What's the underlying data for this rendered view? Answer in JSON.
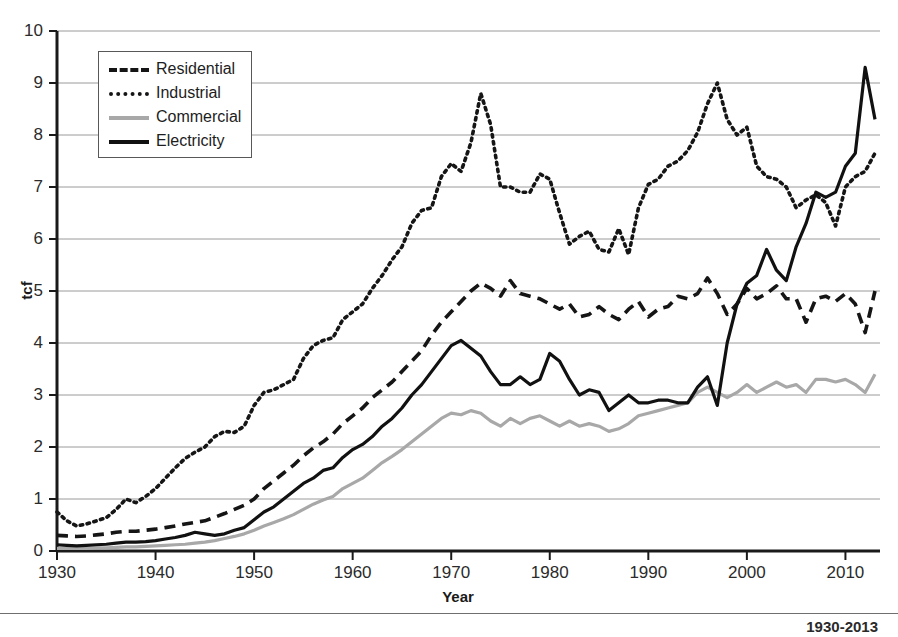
{
  "chart_data": {
    "type": "line",
    "title": "",
    "xlabel": "Year",
    "ylabel": "tcf",
    "xlim": [
      1930,
      2013
    ],
    "ylim": [
      0,
      10
    ],
    "grid": true,
    "legend_position": "top-left",
    "xticks": [
      "1930",
      "1940",
      "1950",
      "1960",
      "1970",
      "1980",
      "1990",
      "2000",
      "2010"
    ],
    "yticks": [
      "0",
      "1",
      "2",
      "3",
      "4",
      "5",
      "6",
      "7",
      "8",
      "9",
      "10"
    ],
    "x": [
      1930,
      1931,
      1932,
      1933,
      1934,
      1935,
      1936,
      1937,
      1938,
      1939,
      1940,
      1941,
      1942,
      1943,
      1944,
      1945,
      1946,
      1947,
      1948,
      1949,
      1950,
      1951,
      1952,
      1953,
      1954,
      1955,
      1956,
      1957,
      1958,
      1959,
      1960,
      1961,
      1962,
      1963,
      1964,
      1965,
      1966,
      1967,
      1968,
      1969,
      1970,
      1971,
      1972,
      1973,
      1974,
      1975,
      1976,
      1977,
      1978,
      1979,
      1980,
      1981,
      1982,
      1983,
      1984,
      1985,
      1986,
      1987,
      1988,
      1989,
      1990,
      1991,
      1992,
      1993,
      1994,
      1995,
      1996,
      1997,
      1998,
      1999,
      2000,
      2001,
      2002,
      2003,
      2004,
      2005,
      2006,
      2007,
      2008,
      2009,
      2010,
      2011,
      2012,
      2013
    ],
    "series": [
      {
        "name": "Residential",
        "style": "dashed",
        "color": "#151515",
        "values": [
          0.3,
          0.29,
          0.28,
          0.29,
          0.31,
          0.33,
          0.36,
          0.38,
          0.38,
          0.4,
          0.42,
          0.45,
          0.48,
          0.52,
          0.55,
          0.58,
          0.65,
          0.72,
          0.8,
          0.88,
          1.0,
          1.2,
          1.35,
          1.5,
          1.65,
          1.83,
          1.98,
          2.1,
          2.25,
          2.45,
          2.6,
          2.75,
          2.95,
          3.1,
          3.25,
          3.45,
          3.65,
          3.85,
          4.15,
          4.4,
          4.6,
          4.8,
          5.0,
          5.15,
          5.05,
          4.9,
          5.2,
          4.95,
          4.9,
          4.85,
          4.75,
          4.65,
          4.75,
          4.5,
          4.55,
          4.7,
          4.55,
          4.45,
          4.65,
          4.8,
          4.5,
          4.65,
          4.7,
          4.9,
          4.85,
          4.95,
          5.25,
          4.95,
          4.55,
          4.75,
          5.05,
          4.85,
          4.95,
          5.1,
          4.85,
          4.85,
          4.4,
          4.85,
          4.9,
          4.8,
          4.95,
          4.75,
          4.2,
          5.0
        ]
      },
      {
        "name": "Industrial",
        "style": "dotted",
        "color": "#151515",
        "values": [
          0.75,
          0.58,
          0.48,
          0.52,
          0.58,
          0.64,
          0.8,
          1.0,
          0.93,
          1.05,
          1.2,
          1.4,
          1.6,
          1.78,
          1.9,
          2.0,
          2.2,
          2.3,
          2.28,
          2.4,
          2.8,
          3.05,
          3.1,
          3.2,
          3.3,
          3.7,
          3.95,
          4.05,
          4.1,
          4.45,
          4.6,
          4.75,
          5.05,
          5.3,
          5.6,
          5.85,
          6.3,
          6.55,
          6.6,
          7.2,
          7.45,
          7.3,
          7.85,
          8.8,
          8.2,
          7.0,
          7.0,
          6.9,
          6.9,
          7.25,
          7.15,
          6.5,
          5.9,
          6.05,
          6.15,
          5.8,
          5.75,
          6.2,
          5.7,
          6.6,
          7.05,
          7.15,
          7.4,
          7.5,
          7.7,
          8.05,
          8.6,
          9.0,
          8.3,
          8.0,
          8.15,
          7.4,
          7.2,
          7.15,
          7.0,
          6.6,
          6.75,
          6.85,
          6.7,
          6.25,
          7.0,
          7.2,
          7.3,
          7.65
        ]
      },
      {
        "name": "Commercial",
        "style": "solid",
        "color": "#a8a8a8",
        "values": [
          0.05,
          0.05,
          0.05,
          0.05,
          0.06,
          0.06,
          0.07,
          0.08,
          0.08,
          0.09,
          0.1,
          0.11,
          0.12,
          0.13,
          0.15,
          0.17,
          0.2,
          0.24,
          0.28,
          0.33,
          0.4,
          0.48,
          0.55,
          0.62,
          0.7,
          0.8,
          0.9,
          0.98,
          1.05,
          1.2,
          1.3,
          1.4,
          1.55,
          1.7,
          1.82,
          1.95,
          2.1,
          2.25,
          2.4,
          2.55,
          2.65,
          2.62,
          2.7,
          2.65,
          2.5,
          2.4,
          2.55,
          2.45,
          2.55,
          2.6,
          2.5,
          2.4,
          2.5,
          2.4,
          2.45,
          2.4,
          2.3,
          2.35,
          2.45,
          2.6,
          2.65,
          2.7,
          2.75,
          2.8,
          2.85,
          3.05,
          3.15,
          3.05,
          2.95,
          3.05,
          3.2,
          3.05,
          3.15,
          3.25,
          3.15,
          3.2,
          3.05,
          3.3,
          3.3,
          3.25,
          3.3,
          3.2,
          3.05,
          3.4
        ]
      },
      {
        "name": "Electricity",
        "style": "solid",
        "color": "#111111",
        "values": [
          0.12,
          0.11,
          0.1,
          0.11,
          0.12,
          0.13,
          0.15,
          0.17,
          0.17,
          0.18,
          0.2,
          0.23,
          0.26,
          0.3,
          0.36,
          0.33,
          0.3,
          0.33,
          0.4,
          0.45,
          0.6,
          0.75,
          0.85,
          1.0,
          1.15,
          1.3,
          1.4,
          1.55,
          1.6,
          1.8,
          1.95,
          2.05,
          2.2,
          2.4,
          2.55,
          2.75,
          3.0,
          3.2,
          3.45,
          3.7,
          3.95,
          4.05,
          3.9,
          3.75,
          3.45,
          3.2,
          3.2,
          3.35,
          3.2,
          3.3,
          3.8,
          3.65,
          3.3,
          3.0,
          3.1,
          3.05,
          2.7,
          2.85,
          3.0,
          2.85,
          2.85,
          2.9,
          2.9,
          2.85,
          2.85,
          3.15,
          3.35,
          2.8,
          4.0,
          4.75,
          5.15,
          5.3,
          5.8,
          5.4,
          5.2,
          5.85,
          6.3,
          6.9,
          6.8,
          6.9,
          7.4,
          7.65,
          9.3,
          8.3
        ]
      }
    ]
  },
  "legend": {
    "items": [
      {
        "label": "Residential",
        "swatch": "dashed-black-line-icon"
      },
      {
        "label": "Industrial",
        "swatch": "dotted-black-line-icon"
      },
      {
        "label": "Commercial",
        "swatch": "solid-gray-line-icon"
      },
      {
        "label": "Electricity",
        "swatch": "solid-black-line-icon"
      }
    ]
  },
  "caption": {
    "text": "1930-2013"
  },
  "colors": {
    "axis": "#1a1a1a",
    "grid": "#9a9a9a",
    "residential": "#151515",
    "industrial": "#151515",
    "commercial": "#a8a8a8",
    "electricity": "#111111"
  }
}
